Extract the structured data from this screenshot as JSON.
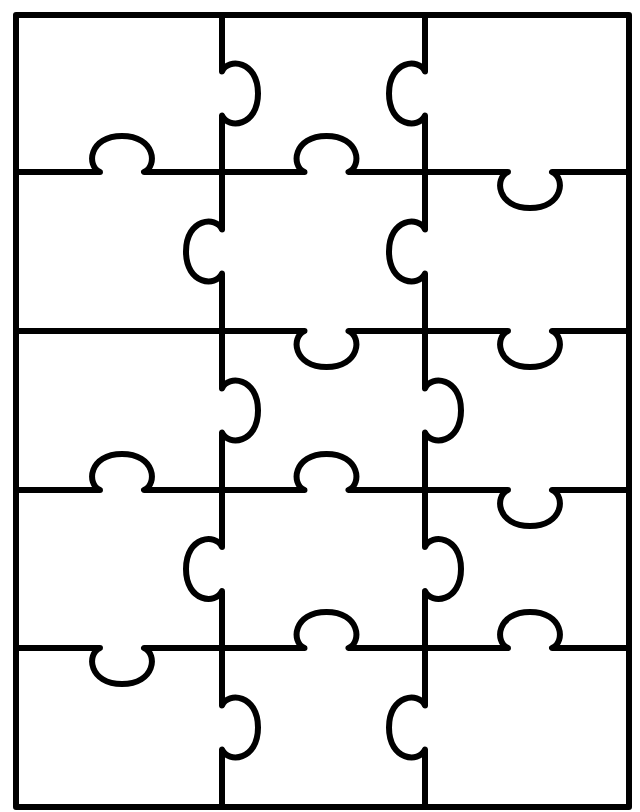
{
  "colors": {
    "line": "#000000",
    "background": "#ffffff"
  },
  "stroke_width": 6,
  "grid": {
    "cols_x": [
      16,
      222,
      425,
      629
    ],
    "rows_y": [
      15,
      172,
      331,
      490,
      648,
      807
    ]
  },
  "knob": {
    "neck": 22,
    "depth": 36,
    "half_width": 33
  },
  "vertical_knobs": [
    {
      "x": 222,
      "row": 0,
      "dir": "right"
    },
    {
      "x": 222,
      "row": 1,
      "dir": "left"
    },
    {
      "x": 222,
      "row": 2,
      "dir": "right"
    },
    {
      "x": 222,
      "row": 3,
      "dir": "left"
    },
    {
      "x": 222,
      "row": 4,
      "dir": "right"
    },
    {
      "x": 425,
      "row": 0,
      "dir": "left"
    },
    {
      "x": 425,
      "row": 1,
      "dir": "left"
    },
    {
      "x": 425,
      "row": 2,
      "dir": "right"
    },
    {
      "x": 425,
      "row": 3,
      "dir": "right"
    },
    {
      "x": 425,
      "row": 4,
      "dir": "left"
    }
  ],
  "horizontal_knobs": [
    {
      "y": 172,
      "col": 0,
      "dir": "up"
    },
    {
      "y": 172,
      "col": 1,
      "dir": "up"
    },
    {
      "y": 172,
      "col": 2,
      "dir": "down"
    },
    {
      "y": 331,
      "col": 1,
      "dir": "down"
    },
    {
      "y": 331,
      "col": 2,
      "dir": "down"
    },
    {
      "y": 490,
      "col": 0,
      "dir": "up"
    },
    {
      "y": 490,
      "col": 1,
      "dir": "up"
    },
    {
      "y": 490,
      "col": 2,
      "dir": "down"
    },
    {
      "y": 648,
      "col": 0,
      "dir": "down"
    },
    {
      "y": 648,
      "col": 1,
      "dir": "up"
    },
    {
      "y": 648,
      "col": 2,
      "dir": "up"
    }
  ],
  "piece_count": 15
}
